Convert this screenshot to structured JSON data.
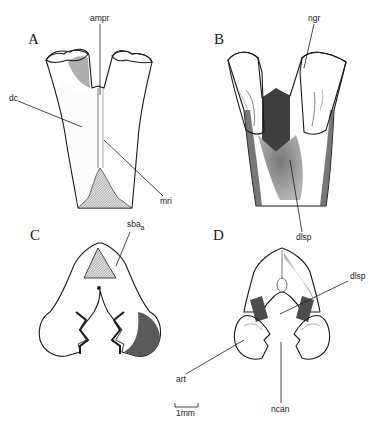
{
  "figure": {
    "panels": [
      {
        "letter": "A",
        "labels": [
          "ampr",
          "dc",
          "mri"
        ]
      },
      {
        "letter": "B",
        "labels": [
          "ngr",
          "dlsp"
        ]
      },
      {
        "letter": "C",
        "labels": [
          "sba",
          "a"
        ]
      },
      {
        "letter": "D",
        "labels": [
          "dlsp",
          "art",
          "ncan"
        ]
      }
    ],
    "scale_bar": {
      "label": "1mm"
    }
  },
  "colors": {
    "ink": "#1a1a1a",
    "paper": "#ffffff",
    "stipple_light": "#d9d9d9",
    "stipple_dark": "#6e6e6e",
    "hatch": "#a8a8a8"
  }
}
